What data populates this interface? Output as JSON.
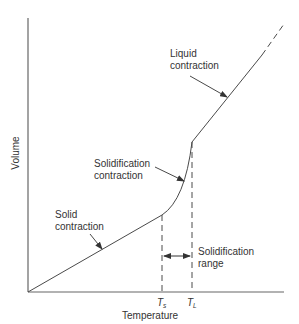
{
  "diagram": {
    "type": "volume-temperature curve",
    "axes": {
      "x_label": "Temperature",
      "y_label": "Volume"
    },
    "x_ticks": [
      {
        "symbol": "T",
        "subscript": "s"
      },
      {
        "symbol": "T",
        "subscript": "L"
      }
    ],
    "regions": [
      {
        "label_line1": "Solid",
        "label_line2": "contraction"
      },
      {
        "label_line1": "Solidification",
        "label_line2": "contraction"
      },
      {
        "label_line1": "Liquid",
        "label_line2": "contraction"
      }
    ],
    "range_annotation": {
      "label_line1": "Solidification",
      "label_line2": "range"
    },
    "colors": {
      "line": "#4a4a4a",
      "text": "#333333",
      "background": "#ffffff"
    }
  }
}
